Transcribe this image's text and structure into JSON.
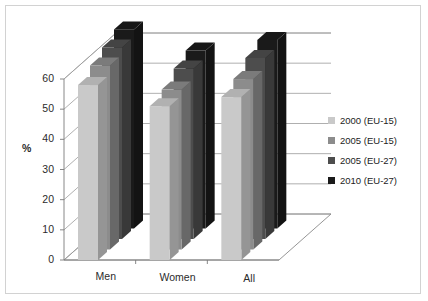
{
  "chart_data": {
    "type": "bar",
    "title": "",
    "subtitle": "",
    "xlabel": "",
    "ylabel": "%",
    "categories": [
      "Men",
      "Women",
      "All"
    ],
    "series": [
      {
        "name": "2000 (EU-15)",
        "color": "#c9c9c9",
        "values": [
          58,
          51,
          54
        ]
      },
      {
        "name": "2005 (EU-15)",
        "color": "#8c8c8c",
        "values": [
          61,
          53,
          56.5
        ]
      },
      {
        "name": "2005 (EU-27)",
        "color": "#4d4d4d",
        "values": [
          63.5,
          56.5,
          60
        ]
      },
      {
        "name": "2010 (EU-27)",
        "color": "#1a1a1a",
        "values": [
          66,
          59,
          62.5
        ]
      }
    ],
    "ylim": [
      0,
      60
    ],
    "ytick_labels": [
      "0",
      "10",
      "20",
      "30",
      "40",
      "50",
      "60"
    ],
    "ytick_values": [
      0,
      10,
      20,
      30,
      40,
      50,
      60
    ],
    "grid": true,
    "three_d": true,
    "legend_position": "right",
    "annotations": []
  },
  "legend": {
    "items": [
      {
        "label": "2000 (EU-15)",
        "color": "#c9c9c9"
      },
      {
        "label": "2005 (EU-15)",
        "color": "#8c8c8c"
      },
      {
        "label": "2005 (EU-27)",
        "color": "#4d4d4d"
      },
      {
        "label": "2010 (EU-27)",
        "color": "#1a1a1a"
      }
    ]
  },
  "colors": {
    "frame": "#d2d2d2",
    "grid": "#9a9a9a",
    "axis": "#7a7a7a",
    "text": "#2b2b2b",
    "background": "#ffffff"
  }
}
